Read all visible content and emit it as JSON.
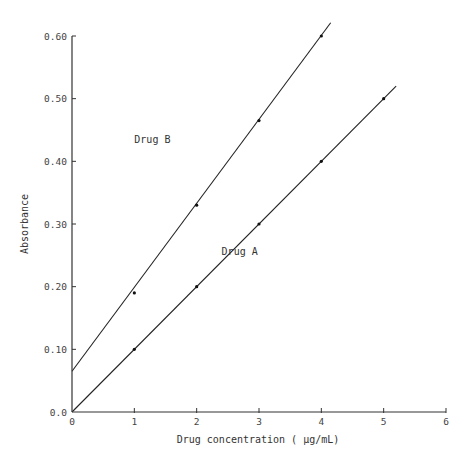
{
  "chart_data": {
    "type": "line",
    "title": "",
    "xlabel": "Drug concentration ( μg/mL)",
    "ylabel": "Absorbance",
    "xlim": [
      0,
      6
    ],
    "ylim": [
      0,
      0.6
    ],
    "x_ticks": [
      0,
      1,
      2,
      3,
      4,
      5,
      6
    ],
    "x_tick_labels": [
      "0",
      "1",
      "2",
      "3",
      "4",
      "5",
      "6"
    ],
    "y_ticks": [
      0,
      0.1,
      0.2,
      0.3,
      0.4,
      0.5,
      0.6
    ],
    "y_tick_labels": [
      "0.0",
      "0.10",
      "0.20",
      "0.30",
      "0.40",
      "0.50",
      "0.60"
    ],
    "grid": false,
    "legend": "inline labels",
    "series": [
      {
        "name": "Drug A",
        "x": [
          1,
          2,
          3,
          4,
          5
        ],
        "values": [
          0.1,
          0.2,
          0.3,
          0.4,
          0.5
        ],
        "fit_line": {
          "intercept": 0.0,
          "slope": 0.1,
          "x_start": 0,
          "x_end": 5.2
        },
        "label_position": [
          2.4,
          0.25
        ]
      },
      {
        "name": "Drug B",
        "x": [
          1,
          2,
          3,
          4
        ],
        "values": [
          0.19,
          0.33,
          0.465,
          0.6
        ],
        "fit_line": {
          "intercept": 0.065,
          "slope": 0.134,
          "x_start": 0,
          "x_end": 4.15
        },
        "label_position": [
          1.0,
          0.43
        ]
      }
    ]
  }
}
